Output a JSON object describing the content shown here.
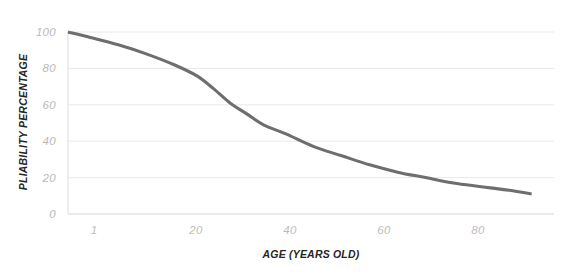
{
  "chart_data": {
    "type": "line",
    "title": "",
    "xlabel": "AGE (YEARS OLD)",
    "ylabel": "PLIABILITY PERCENTAGE",
    "xlim": [
      1,
      88
    ],
    "ylim": [
      0,
      100
    ],
    "grid": true,
    "legend": null,
    "line_color": "#6e6e6e",
    "grid_color": "#e9e9e9",
    "axis_color": "#e2e2e2",
    "tick_label_color": "#bdbdbd",
    "background": "#ffffff",
    "x_ticks": [
      {
        "value": 1,
        "label": "1"
      },
      {
        "value": 20,
        "label": "20"
      },
      {
        "value": 40,
        "label": "40"
      },
      {
        "value": 60,
        "label": "60"
      },
      {
        "value": 80,
        "label": "80"
      }
    ],
    "y_ticks": [
      {
        "value": 0,
        "label": "0"
      },
      {
        "value": 20,
        "label": "20"
      },
      {
        "value": 40,
        "label": "40"
      },
      {
        "value": 60,
        "label": "60"
      },
      {
        "value": 80,
        "label": "80"
      },
      {
        "value": 100,
        "label": "100"
      }
    ],
    "series": [
      {
        "name": "Pliability",
        "x": [
          1,
          5,
          10,
          15,
          20,
          24,
          27,
          30,
          33,
          36,
          40,
          45,
          50,
          55,
          60,
          65,
          70,
          75,
          80,
          84
        ],
        "values": [
          100,
          97,
          93,
          88,
          82,
          76,
          69,
          61,
          55,
          49,
          44,
          37,
          32,
          27,
          23,
          20,
          17,
          15,
          13,
          11
        ]
      }
    ]
  }
}
